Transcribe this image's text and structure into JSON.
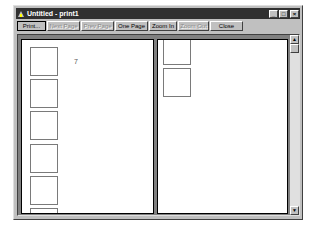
{
  "window": {
    "title": "Untitled - print1",
    "caption_buttons": {
      "minimize": "_",
      "maximize": "□",
      "close": "×"
    }
  },
  "toolbar": {
    "buttons": [
      {
        "label": "Print...",
        "enabled": true,
        "default": true
      },
      {
        "label": "Next Page",
        "enabled": false
      },
      {
        "label": "Prev Page",
        "enabled": false
      },
      {
        "label": "One Page",
        "enabled": true
      },
      {
        "label": "Zoom In",
        "enabled": true
      },
      {
        "label": "Zoom Out",
        "enabled": false
      },
      {
        "label": "Close",
        "enabled": true
      }
    ]
  },
  "preview": {
    "left_page": {
      "page_number": "7",
      "rectangles": 6
    },
    "right_page": {
      "rectangles": 2
    }
  },
  "scrollbar": {
    "up_arrow": "▲",
    "down_arrow": "▼"
  }
}
